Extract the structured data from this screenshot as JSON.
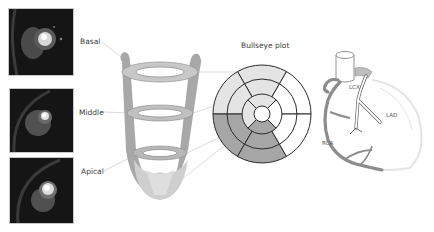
{
  "mri_slices": [
    {
      "id": "basal",
      "label": "Basal"
    },
    {
      "id": "middle",
      "label": "Middle"
    },
    {
      "id": "apical",
      "label": "Apical"
    }
  ],
  "bullseye": {
    "title": "Bullseye plot",
    "rings": [
      {
        "name": "basal",
        "segments": 6
      },
      {
        "name": "mid",
        "segments": 6
      },
      {
        "name": "apical",
        "segments": 4
      },
      {
        "name": "apex",
        "segments": 1
      }
    ],
    "colors": {
      "light": "#e4e4e4",
      "dark": "#a6a6a6",
      "white": "#ffffff",
      "stroke": "#2a2a2a"
    }
  },
  "coronary": {
    "labels": {
      "lcx": "LCX",
      "lad": "LAD",
      "rca": "RCA"
    }
  }
}
